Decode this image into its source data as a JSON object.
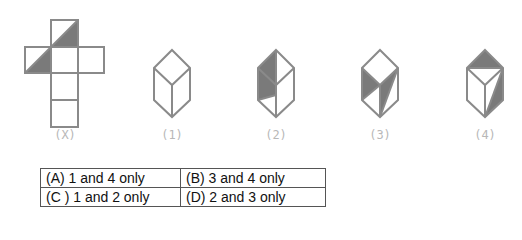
{
  "figures": {
    "stroke_color": "#8a8a8a",
    "fill_color": "#7a7a7a",
    "net": {
      "label": "(X)"
    },
    "cubes": [
      {
        "label": "(1)"
      },
      {
        "label": "(2)"
      },
      {
        "label": "(3)"
      },
      {
        "label": "(4)"
      }
    ]
  },
  "options": [
    {
      "a": "(A)  1 and 4 only",
      "b": "(B) 3 and 4 only"
    },
    {
      "a": "(C )  1 and 2 only",
      "b": "(D) 2 and 3 only"
    }
  ]
}
